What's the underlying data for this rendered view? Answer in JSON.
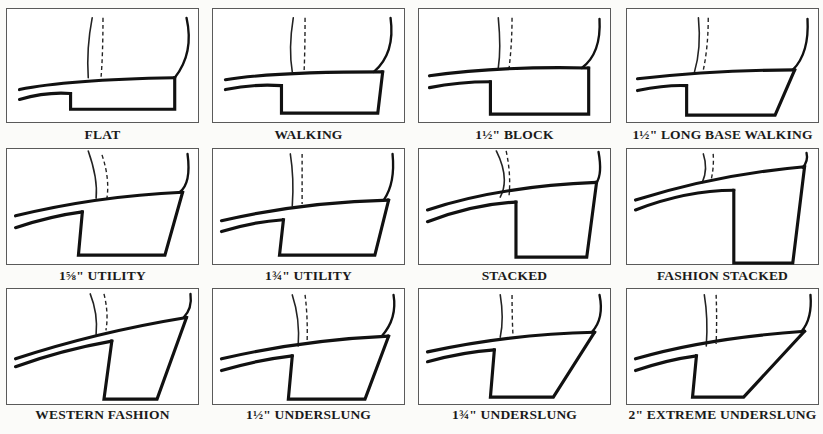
{
  "figure": {
    "panels": [
      {
        "label": "FLAT",
        "box": [
          6,
          8,
          193,
          115
        ],
        "caption_y": 127,
        "upper_sole": "M12,82 Q60,72 170,70",
        "heel": "M170,70 L170,102 L64,102 L64,86",
        "lower_sole": "M12,92 Q40,84 64,86",
        "leg": "M86,9 Q80,40 82,70",
        "dashed": "M97,9 Q97,45 95,70",
        "back": "M182,9 Q190,45 170,70"
      },
      {
        "label": "WALKING",
        "box": [
          212,
          8,
          193,
          115
        ],
        "caption_y": 127,
        "upper_sole": "M12,72 Q60,64 172,64",
        "heel": "M172,64 L167,106 L69,106 L69,78",
        "lower_sole": "M12,82 Q40,76 69,78",
        "leg": "M81,9 Q76,40 80,64",
        "dashed": "M93,9 Q93,40 92,64",
        "back": "M180,9 Q185,45 163,64"
      },
      {
        "label": "1½\" BLOCK",
        "box": [
          418,
          8,
          193,
          115
        ],
        "caption_y": 127,
        "upper_sole": "M10,68 Q80,58 172,60",
        "heel": "M172,60 L172,107 L72,107 L72,74",
        "lower_sole": "M10,80 Q40,74 72,74",
        "leg": "M80,9 Q83,40 80,60",
        "dashed": "M94,9 Q94,35 91,60",
        "back": "M183,10 Q185,45 165,60"
      },
      {
        "label": "1½\" LONG BASE WALKING",
        "box": [
          626,
          8,
          193,
          115
        ],
        "caption_y": 127,
        "upper_sole": "M10,71 Q90,62 170,62",
        "heel": "M170,62 L150,108 L60,108 L60,78",
        "lower_sole": "M10,83 Q40,77 60,78",
        "leg": "M72,9 Q75,40 68,64",
        "dashed": "M82,9 Q82,38 77,62",
        "back": "M183,10 Q185,45 168,62"
      },
      {
        "label": "1⅝\" UTILITY",
        "box": [
          6,
          148,
          193,
          117
        ],
        "caption_y": 268,
        "upper_sole": "M8,68 Q90,48 178,44",
        "heel": "M178,44 L160,108 L72,108 L76,64",
        "lower_sole": "M8,80 Q45,68 76,64",
        "leg": "M82,2 Q92,30 90,50",
        "dashed": "M96,6 Q104,30 101,50",
        "back": "M183,5 Q187,35 175,44"
      },
      {
        "label": "1¾\" UTILITY",
        "box": [
          212,
          148,
          193,
          117
        ],
        "caption_y": 268,
        "upper_sole": "M8,73 Q90,54 178,52",
        "heel": "M178,52 L164,108 L67,108 L71,72",
        "lower_sole": "M8,84 Q40,74 71,72",
        "leg": "M78,5 Q82,30 80,58",
        "dashed": "M90,5 Q90,30 90,56",
        "back": "M182,5 Q185,35 173,52"
      },
      {
        "label": "STACKED",
        "box": [
          418,
          148,
          193,
          117
        ],
        "caption_y": 268,
        "upper_sole": "M8,62 Q80,38 180,34",
        "heel": "M180,34 L170,110 L98,110 L98,54",
        "lower_sole": "M8,74 Q55,56 98,54",
        "leg": "M78,2 Q92,30 82,49",
        "dashed": "M88,2 Q93,25 91,47",
        "back": "M182,3 Q186,25 180,34",
        "no_dashed_upper": false
      },
      {
        "label": "FASHION STACKED",
        "box": [
          626,
          148,
          193,
          117
        ],
        "caption_y": 268,
        "upper_sole": "M8,52 Q90,26 180,18",
        "heel": "M180,18 L168,116 L108,116 L108,42",
        "lower_sole": "M8,62 Q60,42 108,42",
        "leg": "M77,5 Q82,20 76,34",
        "dashed": "M87,5 Q88,18 85,31",
        "back": "M182,4 Q184,12 178,19"
      },
      {
        "label": "WESTERN FASHION",
        "box": [
          6,
          288,
          193,
          117
        ],
        "caption_y": 407,
        "upper_sole": "M8,71 Q90,44 182,29",
        "heel": "M182,29 L152,112 L98,112 L106,53",
        "lower_sole": "M8,79 Q55,62 106,53",
        "leg": "M84,5 Q92,25 90,46",
        "dashed": "M98,5 Q103,25 100,42",
        "back": "M186,5 Q188,20 179,29"
      },
      {
        "label": "1½\" UNDERSLUNG",
        "box": [
          212,
          288,
          193,
          117
        ],
        "caption_y": 407,
        "upper_sole": "M8,71 Q90,52 178,48",
        "heel": "M178,48 L154,112 L76,112 L80,68",
        "lower_sole": "M8,83 Q45,72 80,68",
        "leg": "M80,6 Q88,30 86,58",
        "dashed": "M93,6 Q96,30 95,56",
        "back": "M183,6 Q187,30 171,48"
      },
      {
        "label": "1¾\" UNDERSLUNG",
        "box": [
          418,
          288,
          193,
          117
        ],
        "caption_y": 407,
        "upper_sole": "M8,64 Q90,46 178,44",
        "heel": "M178,44 L136,110 L72,110 L76,62",
        "lower_sole": "M8,74 Q45,64 76,62",
        "leg": "M82,6 Q86,30 82,49",
        "dashed": "M94,6 Q94,30 95,48",
        "back": "M183,6 Q188,30 175,44"
      },
      {
        "label": "2\" EXTREME UNDERSLUNG",
        "box": [
          626,
          288,
          193,
          117
        ],
        "caption_y": 407,
        "upper_sole": "M8,71 Q80,50 180,43",
        "heel": "M180,43 L118,110 L66,110 L70,68",
        "lower_sole": "M8,83 Q40,72 70,68",
        "leg": "M78,6 Q82,30 80,58",
        "dashed": "M90,6 Q91,30 90,56",
        "back": "M186,6 Q188,30 177,43"
      }
    ]
  }
}
